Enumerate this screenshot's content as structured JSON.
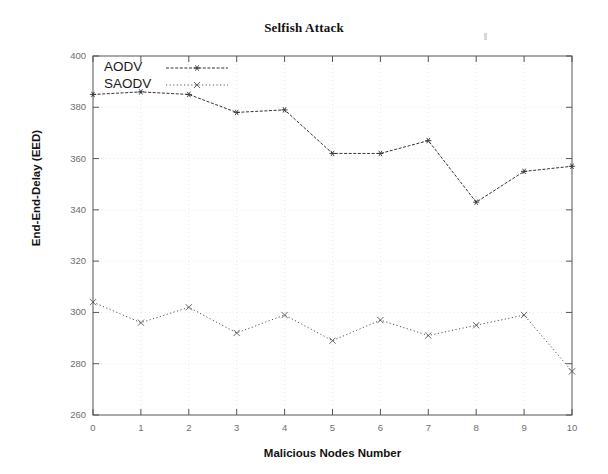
{
  "chart_data": {
    "type": "line",
    "title": "Selfish Attack",
    "xlabel": "Malicious Nodes Number",
    "ylabel": "End-End-Delay (EED)",
    "x": [
      0,
      1,
      2,
      3,
      4,
      5,
      6,
      7,
      8,
      9,
      10
    ],
    "xlim": [
      0,
      10
    ],
    "ylim": [
      260,
      400
    ],
    "xticks": [
      "0",
      "1",
      "2",
      "3",
      "4",
      "5",
      "6",
      "7",
      "8",
      "9",
      "10"
    ],
    "yticks": [
      "260",
      "280",
      "300",
      "320",
      "340",
      "360",
      "380",
      "400"
    ],
    "grid": true,
    "legend_position": "upper-left-inside",
    "series": [
      {
        "name": "AODV",
        "marker": "star",
        "linestyle": "dashed",
        "color": "#333333",
        "values": [
          385,
          386,
          385,
          378,
          379,
          362,
          362,
          367,
          343,
          355,
          357
        ]
      },
      {
        "name": "SAODV",
        "marker": "x",
        "linestyle": "dotted",
        "color": "#555555",
        "values": [
          304,
          296,
          302,
          292,
          299,
          289,
          297,
          291,
          295,
          299,
          277
        ]
      }
    ]
  },
  "legend": {
    "items": [
      {
        "label": "AODV"
      },
      {
        "label": "SAODV"
      }
    ]
  }
}
